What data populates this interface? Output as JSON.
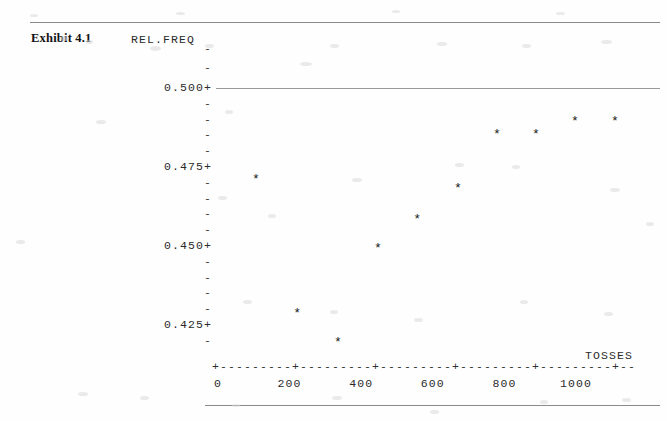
{
  "exhibit": {
    "label": "Exhibit 4.1"
  },
  "axes": {
    "y_title": "REL.FREQ",
    "x_title": "TOSSES",
    "x_axis_ascii": "+---------+---------+---------+---------+---------+--",
    "y_major_labels": [
      "0.500+",
      "0.475+",
      "0.450+",
      "0.425+"
    ],
    "y_minor_tick": "-",
    "x_tick_labels": [
      "0",
      "200",
      "400",
      "600",
      "800",
      "1000"
    ]
  },
  "marker": {
    "glyph": "*"
  },
  "chart_data": {
    "type": "scatter",
    "title": "Exhibit 4.1",
    "xlabel": "TOSSES",
    "ylabel": "REL.FREQ",
    "xlim": [
      0,
      1110
    ],
    "ylim": [
      0.4155,
      0.5045
    ],
    "grid": false,
    "legend": "none",
    "xticks": [
      0,
      200,
      400,
      600,
      800,
      1000
    ],
    "yticks": [
      0.425,
      0.45,
      0.475,
      0.5
    ],
    "reference_line": {
      "y": 0.5,
      "style": "solid",
      "note": "horizontal rule drawn across plot at 0.500"
    },
    "points": [
      {
        "x": 106,
        "y": 0.4712
      },
      {
        "x": 221,
        "y": 0.4288
      },
      {
        "x": 335,
        "y": 0.4195
      },
      {
        "x": 447,
        "y": 0.4494
      },
      {
        "x": 556,
        "y": 0.4587
      },
      {
        "x": 670,
        "y": 0.4684
      },
      {
        "x": 779,
        "y": 0.4856
      },
      {
        "x": 888,
        "y": 0.4856
      },
      {
        "x": 997,
        "y": 0.4894
      },
      {
        "x": 1109,
        "y": 0.4894
      }
    ],
    "series": [
      {
        "name": "Relative frequency of heads",
        "x": [
          106,
          221,
          335,
          447,
          556,
          670,
          779,
          888,
          997,
          1109
        ],
        "values": [
          0.4712,
          0.4288,
          0.4195,
          0.4494,
          0.4587,
          0.4684,
          0.4856,
          0.4856,
          0.4894,
          0.4894
        ]
      }
    ]
  },
  "geometry": {
    "x0_px": 218,
    "x1000_px": 576,
    "y500_px": 88,
    "y425_px": 325
  }
}
